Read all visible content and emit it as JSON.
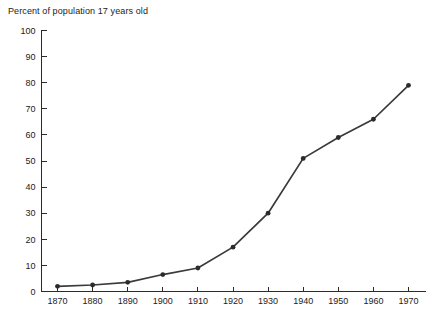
{
  "chart_data": {
    "type": "line",
    "title": "Percent of population 17 years old",
    "xlabel": "",
    "ylabel": "",
    "xlim": [
      1870,
      1970
    ],
    "ylim": [
      0,
      100
    ],
    "grid": false,
    "legend": false,
    "x": [
      1870,
      1880,
      1890,
      1900,
      1910,
      1920,
      1930,
      1940,
      1950,
      1960,
      1970
    ],
    "values": [
      2,
      2.5,
      3.5,
      6.5,
      9,
      17,
      30,
      51,
      59,
      66,
      79
    ],
    "xticks": [
      "1870",
      "1880",
      "1890",
      "1900",
      "1910",
      "1920",
      "1930",
      "1940",
      "1950",
      "1960",
      "1970"
    ],
    "yticks": [
      "0",
      "10",
      "20",
      "30",
      "40",
      "50",
      "60",
      "70",
      "80",
      "90",
      "100"
    ],
    "marker": "circle",
    "line_color": "#3a3a3a",
    "marker_color": "#2b2b2b",
    "axis_color": "#2b2b2b",
    "background": "#ffffff"
  }
}
